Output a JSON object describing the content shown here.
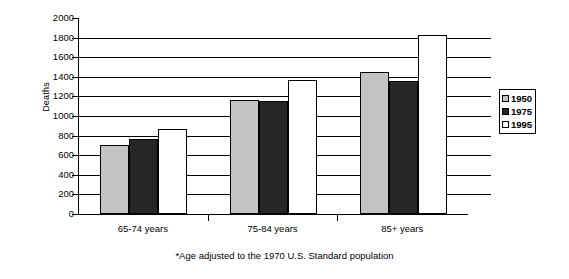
{
  "chart_data": {
    "type": "bar",
    "title": "",
    "xlabel": "",
    "ylabel": "Deaths",
    "categories": [
      "65-74 years",
      "75-84 years",
      "85+ years"
    ],
    "series": [
      {
        "name": "1950",
        "color": "#c3c3c3",
        "values": [
          700,
          1160,
          1445
        ]
      },
      {
        "name": "1975",
        "color": "#262626",
        "values": [
          765,
          1155,
          1360
        ]
      },
      {
        "name": "1995",
        "color": "#ffffff",
        "values": [
          870,
          1365,
          1830
        ]
      }
    ],
    "ylim": [
      0,
      2000
    ],
    "ytick_labels": [
      "2000",
      "1800",
      "1600",
      "1400",
      "1200",
      "1000",
      "800",
      "600",
      "400",
      "200",
      "0"
    ],
    "ytick_values": [
      2000,
      1800,
      1600,
      1400,
      1200,
      1000,
      800,
      600,
      400,
      200,
      0
    ],
    "grid": true,
    "legend_position": "right",
    "annotations": [
      "*Age adjusted to the 1970 U.S. Standard population"
    ]
  },
  "legend": {
    "entries": [
      {
        "label": "1950"
      },
      {
        "label": "1975"
      },
      {
        "label": "1995"
      }
    ]
  },
  "footnote": "*Age adjusted to the 1970 U.S. Standard population"
}
